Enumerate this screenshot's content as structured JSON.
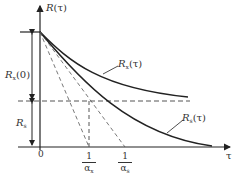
{
  "diagram": {
    "y_axis_label": {
      "main": "R",
      "arg": "(τ)"
    },
    "x_axis_label": "τ",
    "origin_label": "0",
    "left_labels": [
      {
        "main": "R",
        "sub": "x",
        "suffix": "(0)"
      },
      {
        "main": "R",
        "sub": "s",
        "suffix": ""
      }
    ],
    "curves": [
      {
        "main": "R",
        "sub": "x",
        "suffix": "(τ)",
        "role": "upper curve, levels off above dashed level"
      },
      {
        "main": "R",
        "sub": "s",
        "suffix": "(τ)",
        "role": "lower curve, decays toward axis"
      }
    ],
    "x_ticks": [
      {
        "num": "1",
        "den": "α",
        "den_sub": "x"
      },
      {
        "num": "1",
        "den": "α",
        "den_sub": "s"
      }
    ],
    "colors": {
      "line": "#222222",
      "dashed": "#555555",
      "text": "#333333"
    }
  }
}
